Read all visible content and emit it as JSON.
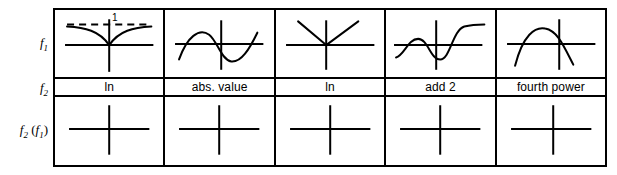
{
  "figure": {
    "type": "function-composition-table",
    "row_labels": [
      {
        "id": "f1",
        "base": "f",
        "sub": "1",
        "suffix": ""
      },
      {
        "id": "f2",
        "base": "f",
        "sub": "2",
        "suffix": ""
      },
      {
        "id": "f2f1",
        "base": "f",
        "sub": "2",
        "suffix": " (f1)"
      }
    ],
    "row_label_text": {
      "f1_base": "f",
      "f1_sub": "1",
      "f2_base": "f",
      "f2_sub": "2",
      "f2f1_base": "f",
      "f2f1_sub": "2",
      "f2f1_open": " (",
      "f2f1_inner_base": "f",
      "f2f1_inner_sub": "1",
      "f2f1_close": ")"
    },
    "columns": [
      {
        "index": 1,
        "f1_graph": "cusp-curve-approaching-asymptote-1",
        "f1_annotation": "1",
        "f2_label": "ln",
        "f2f1_graph": "empty-axes"
      },
      {
        "index": 2,
        "f1_graph": "sine-wave",
        "f1_annotation": "",
        "f2_label": "abs. value",
        "f2f1_graph": "empty-axes"
      },
      {
        "index": 3,
        "f1_graph": "v-shape-absolute-value",
        "f1_annotation": "",
        "f2_label": "ln",
        "f2f1_graph": "empty-axes"
      },
      {
        "index": 4,
        "f1_graph": "wavy-rising-curve",
        "f1_annotation": "",
        "f2_label": "add 2",
        "f2f1_graph": "empty-axes"
      },
      {
        "index": 5,
        "f1_graph": "downward-parabola-arch",
        "f1_annotation": "",
        "f2_label": "fourth power",
        "f2f1_graph": "empty-axes"
      }
    ],
    "colors": {
      "ink": "#000000",
      "background": "#ffffff"
    }
  }
}
